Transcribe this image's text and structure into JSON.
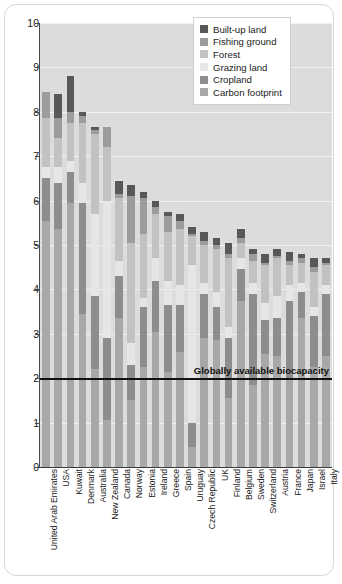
{
  "chart_data": {
    "type": "bar",
    "stacked": true,
    "title": "",
    "xlabel": "",
    "ylabel": "Global hectares per person",
    "ylim": [
      0,
      10
    ],
    "yticks": [
      0,
      1,
      2,
      3,
      4,
      5,
      6,
      7,
      8,
      9,
      10
    ],
    "grid": true,
    "legend_position": "top-right",
    "categories": [
      "United Arab Emirates",
      "USA",
      "Kuwait",
      "Denmark",
      "Australia",
      "New Zealand",
      "Canada",
      "Norway",
      "Estonia",
      "Ireland",
      "Greece",
      "Spain",
      "Uruguay",
      "Czech Republic",
      "UK",
      "Finland",
      "Belgium",
      "Sweden",
      "Switzerland",
      "Austria",
      "France",
      "Japan",
      "Israel",
      "Italy"
    ],
    "series": [
      {
        "name": "Carbon footprint",
        "color": "#a8a8a8",
        "values": [
          5.55,
          5.35,
          5.95,
          3.45,
          2.2,
          1.05,
          3.35,
          1.5,
          2.25,
          3.05,
          2.15,
          2.6,
          0.45,
          2.9,
          2.85,
          1.55,
          3.75,
          1.85,
          2.55,
          2.5,
          1.95,
          3.35,
          2.25,
          2.5
        ]
      },
      {
        "name": "Cropland",
        "color": "#8d8d8d",
        "values": [
          0.95,
          1.05,
          0.7,
          2.5,
          1.65,
          1.85,
          0.95,
          0.8,
          1.35,
          1.15,
          1.5,
          1.05,
          0.55,
          1.0,
          0.75,
          1.35,
          0.7,
          2.05,
          0.75,
          0.85,
          1.8,
          0.6,
          1.15,
          1.4
        ]
      },
      {
        "name": "Grazing land",
        "color": "#e6e6e6",
        "values": [
          0.25,
          0.35,
          0.25,
          0.45,
          1.85,
          3.1,
          0.35,
          0.5,
          0.2,
          0.5,
          0.55,
          0.45,
          3.55,
          0.25,
          0.35,
          0.25,
          0.25,
          0.25,
          0.4,
          0.5,
          0.35,
          0.2,
          0.2,
          0.2
        ]
      },
      {
        "name": "Forest",
        "color": "#c2c2c2",
        "values": [
          1.1,
          0.65,
          0.85,
          1.35,
          1.8,
          1.2,
          1.4,
          2.25,
          1.45,
          1.0,
          1.1,
          1.25,
          0.65,
          0.85,
          0.95,
          1.55,
          0.35,
          0.5,
          0.85,
          0.85,
          0.45,
          0.45,
          0.8,
          0.45
        ]
      },
      {
        "name": "Fishing ground",
        "color": "#9c9c9c",
        "values": [
          0.6,
          0.45,
          0.25,
          0.15,
          0.1,
          0.45,
          0.1,
          1.05,
          0.8,
          0.15,
          0.35,
          0.2,
          0.05,
          0.1,
          0.1,
          0.1,
          0.1,
          0.15,
          0.05,
          0.05,
          0.1,
          0.1,
          0.1,
          0.05
        ]
      },
      {
        "name": "Built-up land",
        "color": "#585858",
        "values": [
          0.0,
          0.55,
          0.8,
          0.1,
          0.05,
          0.0,
          0.3,
          0.25,
          0.15,
          0.15,
          0.1,
          0.15,
          0.15,
          0.2,
          0.15,
          0.25,
          0.2,
          0.1,
          0.2,
          0.15,
          0.2,
          0.1,
          0.2,
          0.1
        ]
      }
    ],
    "reference_line": {
      "label": "Globally available biocapacity",
      "value": 2.0,
      "color": "#111111"
    },
    "totals": [
      8.45,
      8.4,
      8.8,
      8.0,
      7.65,
      7.65,
      6.45,
      6.35,
      6.2,
      6.0,
      5.75,
      5.7,
      5.4,
      5.3,
      5.15,
      5.05,
      5.35,
      4.9,
      4.8,
      4.9,
      4.85,
      4.8,
      4.7,
      4.7
    ]
  },
  "axis": {
    "y_title": "Global hectares per person",
    "y_tick_labels": [
      "10",
      "9",
      "8",
      "7",
      "6",
      "5",
      "4",
      "3",
      "2",
      "1",
      "0"
    ]
  },
  "legend": {
    "items": [
      {
        "label": "Built-up land",
        "color": "#585858"
      },
      {
        "label": "Fishing ground",
        "color": "#9c9c9c"
      },
      {
        "label": "Forest",
        "color": "#c2c2c2"
      },
      {
        "label": "Grazing land",
        "color": "#e6e6e6"
      },
      {
        "label": "Cropland",
        "color": "#8d8d8d"
      },
      {
        "label": "Carbon footprint",
        "color": "#a8a8a8"
      }
    ]
  },
  "annotation": {
    "biocapacity_label": "Globally available biocapacity"
  }
}
